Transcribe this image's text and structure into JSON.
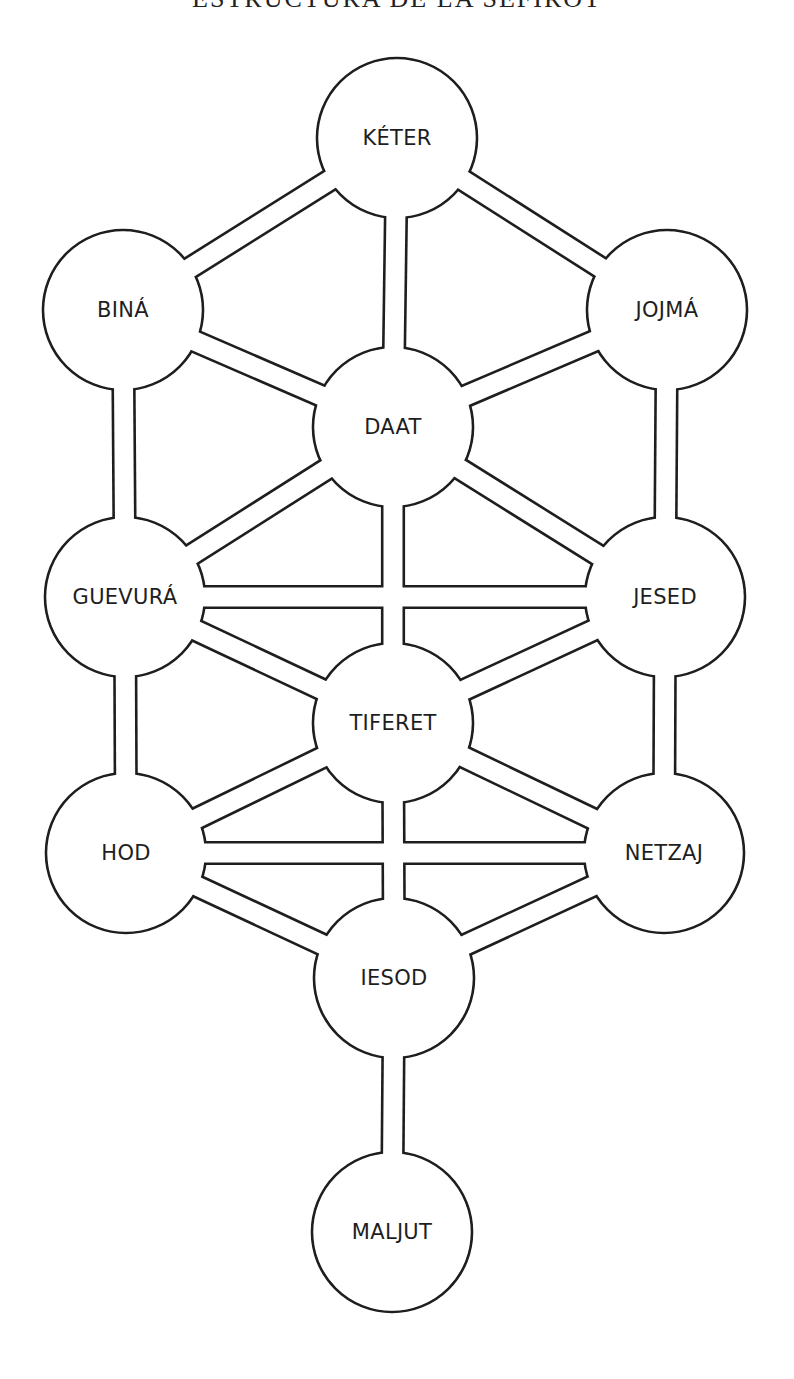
{
  "title": "ESTRUCTURA DE LA SEFIRÓT",
  "diagram": {
    "type": "tree-of-life",
    "stroke_color": "#1e1e1e",
    "background_color": "#ffffff",
    "node_radius": 80,
    "channel_width": 19,
    "nodes": [
      {
        "id": "keter",
        "label": "KÉTER",
        "cx": 397,
        "cy": 138
      },
      {
        "id": "bina",
        "label": "BINÁ",
        "cx": 123,
        "cy": 310
      },
      {
        "id": "jojma",
        "label": "JOJMÁ",
        "cx": 667,
        "cy": 310
      },
      {
        "id": "daat",
        "label": "DAAT",
        "cx": 393,
        "cy": 427
      },
      {
        "id": "guevura",
        "label": "GUEVURÁ",
        "cx": 125,
        "cy": 597
      },
      {
        "id": "jesed",
        "label": "JESED",
        "cx": 665,
        "cy": 597
      },
      {
        "id": "tiferet",
        "label": "TIFERET",
        "cx": 393,
        "cy": 723
      },
      {
        "id": "hod",
        "label": "HOD",
        "cx": 126,
        "cy": 853
      },
      {
        "id": "netzaj",
        "label": "NETZAJ",
        "cx": 664,
        "cy": 853
      },
      {
        "id": "iesod",
        "label": "IESOD",
        "cx": 394,
        "cy": 978
      },
      {
        "id": "maljut",
        "label": "MALJUT",
        "cx": 392,
        "cy": 1232
      }
    ],
    "paths": [
      [
        "keter",
        "bina"
      ],
      [
        "keter",
        "jojma"
      ],
      [
        "keter",
        "daat"
      ],
      [
        "bina",
        "daat"
      ],
      [
        "jojma",
        "daat"
      ],
      [
        "bina",
        "guevura"
      ],
      [
        "jojma",
        "jesed"
      ],
      [
        "daat",
        "guevura"
      ],
      [
        "daat",
        "jesed"
      ],
      [
        "daat",
        "tiferet"
      ],
      [
        "guevura",
        "jesed"
      ],
      [
        "guevura",
        "tiferet"
      ],
      [
        "jesed",
        "tiferet"
      ],
      [
        "guevura",
        "hod"
      ],
      [
        "jesed",
        "netzaj"
      ],
      [
        "tiferet",
        "hod"
      ],
      [
        "tiferet",
        "netzaj"
      ],
      [
        "tiferet",
        "iesod"
      ],
      [
        "hod",
        "netzaj"
      ],
      [
        "hod",
        "iesod"
      ],
      [
        "netzaj",
        "iesod"
      ],
      [
        "iesod",
        "maljut"
      ]
    ]
  }
}
